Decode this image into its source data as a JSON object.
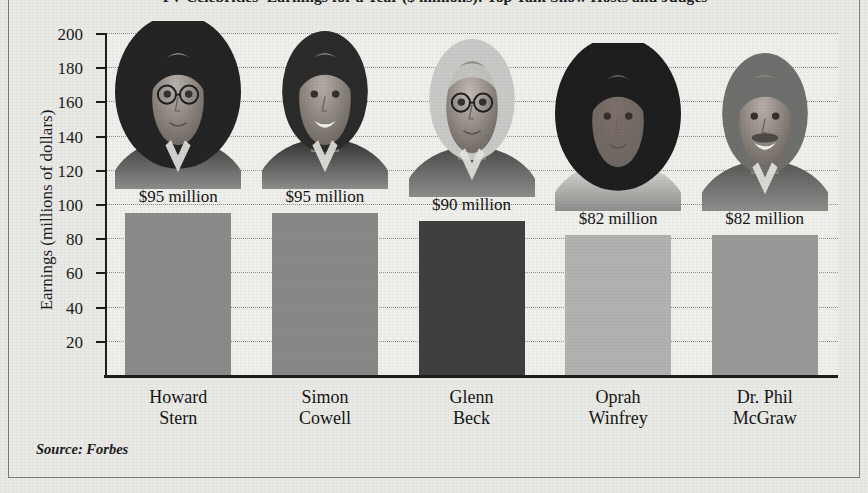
{
  "chart_data": {
    "type": "bar",
    "title": "TV Celebrities' Earnings for a Year ($ millions): Top Talk Show Hosts and Judges",
    "xlabel": "",
    "ylabel": "Earnings (millions of dollars)",
    "ylim": [
      0,
      200
    ],
    "ytick_step": 20,
    "yticks": [
      20,
      40,
      60,
      80,
      100,
      120,
      140,
      160,
      180,
      200
    ],
    "grid": true,
    "legend": "none",
    "categories": [
      "Howard Stern",
      "Simon Cowell",
      "Glenn Beck",
      "Oprah Winfrey",
      "Dr. Phil McGraw"
    ],
    "category_lines": [
      [
        "Howard",
        "Stern"
      ],
      [
        "Simon",
        "Cowell"
      ],
      [
        "Glenn",
        "Beck"
      ],
      [
        "Oprah",
        "Winfrey"
      ],
      [
        "Dr. Phil",
        "McGraw"
      ]
    ],
    "values": [
      95,
      95,
      90,
      82,
      82
    ],
    "data_labels": [
      "$95 million",
      "$95 million",
      "$90 million",
      "$82 million",
      "$82 million"
    ],
    "bar_colors": [
      "#8b8b89",
      "#898987",
      "#3f3f3f",
      "#b2b2b0",
      "#9a9a98"
    ],
    "source": "Source: Forbes",
    "units": "millions of dollars",
    "portrait_labels": [
      "howard-stern-photo",
      "simon-cowell-photo",
      "glenn-beck-photo",
      "oprah-winfrey-photo",
      "dr-phil-mcgraw-photo"
    ]
  },
  "colors": {
    "paper_background": "#e9e9e6",
    "plot_background": "#efefec",
    "axis": "#1d1d1d",
    "gridline": "#8f8f8c",
    "text": "#1c1c1c",
    "frame": "#7e7e7c"
  }
}
